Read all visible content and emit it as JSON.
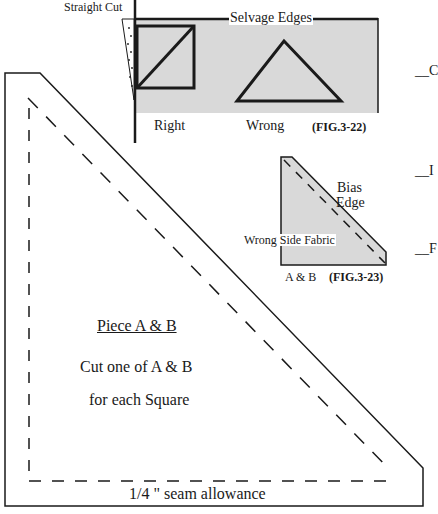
{
  "colors": {
    "line": "#1a1a1a",
    "fabric_fill": "#d9d9d9",
    "background": "#ffffff"
  },
  "fig_3_22": {
    "straight_cut_label": "Straight Cut",
    "selvage_label": "Selvage Edges",
    "right_label": "Right",
    "wrong_label": "Wrong",
    "figure_label": "(FIG.3-22)"
  },
  "fig_3_23": {
    "bias_label_line1": "Bias",
    "bias_label_line2": "Edge",
    "wrong_side_label": "Wrong Side Fabric",
    "piece_label": "A & B",
    "figure_label": "(FIG.3-23)"
  },
  "pattern_piece": {
    "title": "Piece A & B",
    "instruction_line1": "Cut one of A & B",
    "instruction_line2": "for each Square",
    "seam_label": "1/4 \" seam allowance"
  },
  "checklist_marks": [
    {
      "label": "__C"
    },
    {
      "label": "__I"
    },
    {
      "label": "__F"
    }
  ]
}
